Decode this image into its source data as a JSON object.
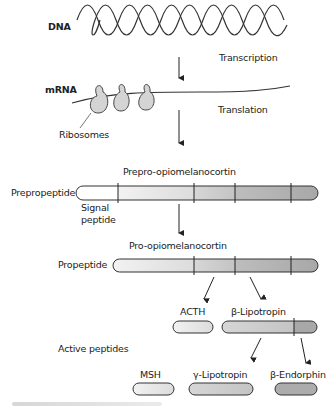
{
  "diagram": {
    "stages": {
      "dna": {
        "label": "DNA"
      },
      "transcription": {
        "label": "Transcription"
      },
      "mrna": {
        "label": "mRNA"
      },
      "translation": {
        "label": "Translation"
      },
      "ribosomes": {
        "label": "Ribosomes"
      },
      "prepro": {
        "title": "Prepro-opiomelanocortin",
        "row_label": "Prepropeptide",
        "signal_label_1": "Signal",
        "signal_label_2": "peptide"
      },
      "pro": {
        "title": "Pro-opiomelanocortin",
        "row_label": "Propeptide"
      },
      "active": {
        "row_label": "Active peptides"
      }
    },
    "peptides": [
      {
        "name": "ACTH"
      },
      {
        "name": "β-Lipotropin"
      },
      {
        "name": "MSH"
      },
      {
        "name": "γ-Lipotropin"
      },
      {
        "name": "β-Endorphin"
      }
    ],
    "colors": {
      "stroke": "#333333",
      "seg0": "#ffffff",
      "seg1": "#e6e6e6",
      "seg2": "#c8c8c8",
      "seg3": "#b0b0b0",
      "ribosome": "#d4d4d4"
    }
  }
}
